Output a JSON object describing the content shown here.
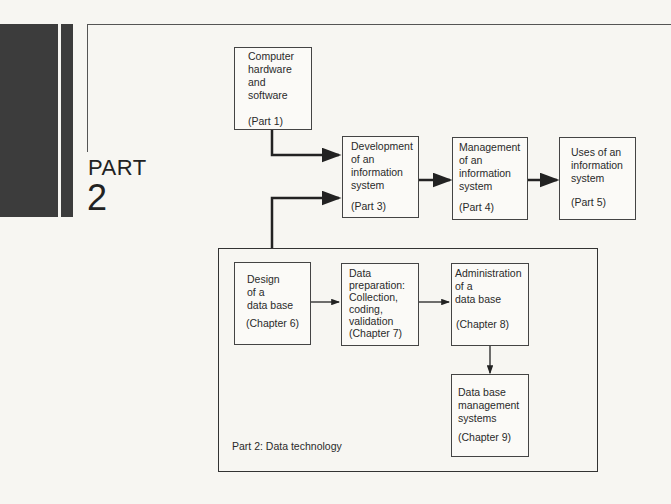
{
  "header": {
    "part_label": "PART",
    "part_number": "2"
  },
  "boxes": {
    "hardware": {
      "text": "Computer\nhardware\nand\nsoftware",
      "ref": "(Part 1)"
    },
    "development": {
      "text": "Development\nof an\ninformation\nsystem",
      "ref": "(Part 3)"
    },
    "management": {
      "text": "Management\nof an\ninformation\nsystem",
      "ref": "(Part 4)"
    },
    "uses": {
      "text": "Uses of an\ninformation\nsystem",
      "ref": "(Part 5)"
    },
    "design": {
      "text": "Design\nof a\ndata base",
      "ref": "(Chapter 6)"
    },
    "preparation": {
      "text": "Data\npreparation:\nCollection,\ncoding,\nvalidation",
      "ref": "(Chapter 7)"
    },
    "administration": {
      "text": "Administration\nof a\ndata base",
      "ref": "(Chapter 8)"
    },
    "dbms": {
      "text": "Data base\nmanagement\nsystems",
      "ref": "(Chapter 9)"
    }
  },
  "group": {
    "label": "Part 2: Data technology"
  }
}
